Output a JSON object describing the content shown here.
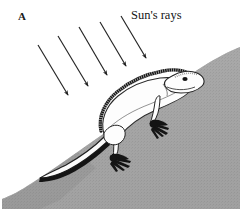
{
  "figure": {
    "panel_label": "A",
    "rays_label": "Sun's rays",
    "caption_alt": "Lizard basking on a sloped rock surface with sun's rays striking at an angle",
    "colors": {
      "background": "#ffffff",
      "rock_gray": "#a5a5a5",
      "rock_gray_light": "#b4b4b4",
      "ink": "#1a1a1a",
      "animal_body": "#fdfdfd",
      "shadow_gray": "#8f8f8f"
    },
    "panel_label_position": {
      "x": 18,
      "y": 12
    },
    "rays_label_position": {
      "x": 130,
      "y": 10
    }
  },
  "sun_rays": {
    "count": 5,
    "direction_degrees": 61,
    "arrows": [
      {
        "x1": 38,
        "y1": 45,
        "x2": 68,
        "y2": 95
      },
      {
        "x1": 58,
        "y1": 36,
        "x2": 88,
        "y2": 86
      },
      {
        "x1": 79,
        "y1": 27,
        "x2": 107,
        "y2": 75
      },
      {
        "x1": 100,
        "y1": 22,
        "x2": 126,
        "y2": 66
      },
      {
        "x1": 121,
        "y1": 16,
        "x2": 146,
        "y2": 58
      }
    ]
  },
  "rock": {
    "name": "sloped-rock-surface",
    "outline_points": "2,206 2,196 14,188 34,176 58,162 84,146 112,128 140,110 166,94 188,80 206,68 222,58 236,50 240,48 240,206",
    "crest_from": {
      "x": 240,
      "y": 48
    },
    "crest_to": {
      "x": 2,
      "y": 200
    }
  },
  "lizard": {
    "name": "basking-lizard",
    "parts": [
      "dorsal-crest",
      "head",
      "eye",
      "body",
      "front-leg",
      "front-foot",
      "hind-leg",
      "hind-foot",
      "tail"
    ],
    "eye_position": {
      "x": 185,
      "y": 78
    },
    "head_tip": {
      "x": 202,
      "y": 82
    },
    "tail_tip": {
      "x": 40,
      "y": 178
    }
  }
}
